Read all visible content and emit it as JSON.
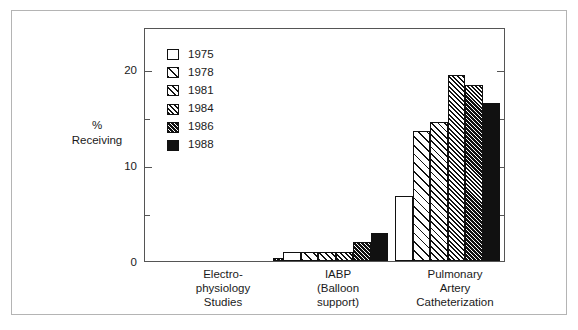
{
  "chart_data": {
    "type": "bar",
    "title": "",
    "subtitle": "",
    "xlabel": "",
    "ylabel": "%\nReceiving",
    "ylabel_lines": [
      "%",
      "Receiving"
    ],
    "categories": [
      "Electro-\nphysiology\nStudies",
      "IABP\n(Balloon\nsupport)",
      "Pulmonary\nArtery\nCatheterization"
    ],
    "category_lines": [
      [
        "Electro-",
        "physiology",
        "Studies"
      ],
      [
        "IABP",
        "(Balloon",
        "support)"
      ],
      [
        "Pulmonary",
        "Artery",
        "Catheterization"
      ]
    ],
    "series": [
      {
        "name": "1975",
        "pattern": "solid-white",
        "values": [
          0,
          1.0,
          7.0
        ]
      },
      {
        "name": "1978",
        "pattern": "hatch1",
        "values": [
          0,
          1.0,
          14.0
        ]
      },
      {
        "name": "1981",
        "pattern": "hatch2",
        "values": [
          0,
          1.0,
          15.0
        ]
      },
      {
        "name": "1984",
        "pattern": "hatch3",
        "values": [
          0,
          1.0,
          20.0
        ]
      },
      {
        "name": "1986",
        "pattern": "hatch4",
        "values": [
          0.3,
          2.0,
          19.0
        ]
      },
      {
        "name": "1988",
        "pattern": "solid-black",
        "values": [
          0.5,
          3.0,
          17.0
        ]
      }
    ],
    "ylim": [
      0,
      25
    ],
    "yticks_major": [
      0,
      10,
      20
    ],
    "yticks_major_labels": [
      "0",
      "10",
      "20"
    ],
    "yticks_minor": [
      5,
      15,
      25
    ],
    "grid": false,
    "legend_position": "inside-top-left",
    "legend_entries": [
      "1975",
      "1978",
      "1981",
      "1984",
      "1986",
      "1988"
    ],
    "colors": {
      "axis": "#555555",
      "bar_outline": "#111111",
      "bar_fill_light": "#ffffff",
      "bar_fill_dark": "#111111",
      "outer_border": "#b4b4b4",
      "background": "#ffffff",
      "text": "#1a1a1a"
    }
  }
}
